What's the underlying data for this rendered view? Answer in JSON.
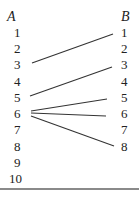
{
  "diagram": {
    "set_a": {
      "label": "A",
      "elements": [
        "1",
        "2",
        "3",
        "4",
        "5",
        "6",
        "7",
        "8",
        "9",
        "10"
      ]
    },
    "set_b": {
      "label": "B",
      "elements": [
        "1",
        "2",
        "3",
        "4",
        "5",
        "6",
        "7",
        "8"
      ]
    },
    "mappings": [
      {
        "from": "3",
        "to": "1"
      },
      {
        "from": "5",
        "to": "3"
      },
      {
        "from": "6",
        "to": "5"
      },
      {
        "from": "6",
        "to": "6"
      },
      {
        "from": "6",
        "to": "8"
      }
    ],
    "line_color": "#333333"
  }
}
